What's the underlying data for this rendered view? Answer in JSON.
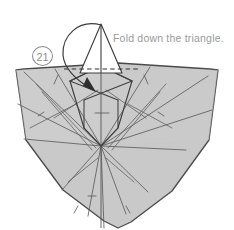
{
  "diagram": {
    "step_label": "21",
    "instruction": "Fold down the triangle.",
    "colors": {
      "paper_fill": "#c9c9c9",
      "paper_fill_light": "#d2d2d2",
      "outline": "#4a4a4a",
      "crease": "#5a5a5a",
      "text": "#9a9a9a",
      "step_badge": "#8d8d8d",
      "arrow": "#3c3c3c",
      "flap_fill": "#ffffff",
      "background": "#ffffff"
    },
    "shapes": {
      "shield": {
        "name": "shield-body",
        "description": "Rounded triangular paper body, light gray fill",
        "points": "16,70 24,69 118,63 210,69 218,70 209,140 172,191 131,222 118,228 104,221 63,190 26,140"
      },
      "flap": {
        "name": "triangle-flap",
        "description": "White triangular flap standing above the fold line",
        "points": "101,24 80,73 122,73"
      },
      "diamond": {
        "name": "diamond-crease-shape",
        "description": "Kite/diamond shape under the fold line",
        "points": "101,66 132,81 118,128 101,146 84,128 70,81"
      },
      "fold_line": {
        "name": "dashed-fold-line",
        "y": 69,
        "x1": 64,
        "x2": 139
      },
      "arrow": {
        "name": "fold-down-arrow",
        "description": "Curved arrow looping over the apex pointing down into the body",
        "path": "M101,25 C78,20 63,36 64,54 C65,68 78,80 91,88",
        "head_points": "95,91 84,85 87,78"
      },
      "center_hub": {
        "name": "crease-hub",
        "x": 101,
        "y": 146
      }
    },
    "creases": {
      "radiating": [
        "101,146 24,72",
        "101,146 55,69",
        "101,146 18,104",
        "101,146 24,139",
        "101,146 62,190",
        "101,146 88,216",
        "101,146 104,228",
        "101,146 126,214",
        "101,146 148,192",
        "101,146 186,150",
        "101,146 212,110",
        "101,146 208,76",
        "101,146 150,67"
      ],
      "secondary": [
        "36,84 96,148",
        "42,92 92,150",
        "166,84 108,148",
        "160,92 112,150",
        "54,118 98,90",
        "146,118 106,90",
        "68,182 98,158",
        "134,182 106,158",
        "30,128 76,104",
        "172,128 128,104"
      ],
      "ticks": [
        "58,75 54,84",
        "144,75 148,84",
        "44,112 38,116",
        "158,112 164,116",
        "78,206 74,213",
        "126,206 130,213",
        "88,196 96,196",
        "95,113 109,113"
      ]
    }
  }
}
